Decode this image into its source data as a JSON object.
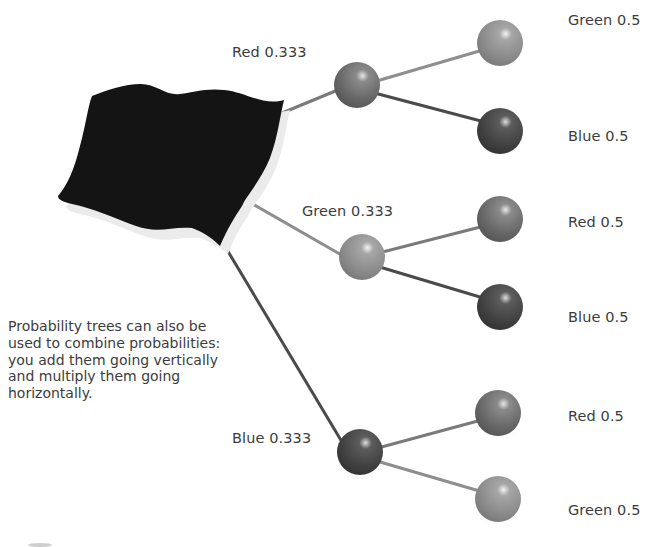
{
  "diagram": {
    "type": "probability-tree",
    "root": {
      "name": "bag-of-balls"
    },
    "colors": {
      "red": "#6a6a6a",
      "green": "#8c8c8c",
      "blue": "#444444",
      "bag": "#141414"
    },
    "first_level": [
      {
        "color": "Red",
        "label": "Red 0.333",
        "probability": 0.333,
        "children": [
          {
            "label": "Green 0.5",
            "color": "Green",
            "probability": 0.5
          },
          {
            "label": "Blue 0.5",
            "color": "Blue",
            "probability": 0.5
          }
        ]
      },
      {
        "color": "Green",
        "label": "Green 0.333",
        "probability": 0.333,
        "children": [
          {
            "label": "Red 0.5",
            "color": "Red",
            "probability": 0.5
          },
          {
            "label": "Blue 0.5",
            "color": "Blue",
            "probability": 0.5
          }
        ]
      },
      {
        "color": "Blue",
        "label": "Blue 0.333",
        "probability": 0.333,
        "children": [
          {
            "label": "Red 0.5",
            "color": "Red",
            "probability": 0.5
          },
          {
            "label": "Green 0.5",
            "color": "Green",
            "probability": 0.5
          }
        ]
      }
    ],
    "caption": "Probability trees can also be used to combine probabilities: you add them going vertically and multiply them going horizontally."
  }
}
